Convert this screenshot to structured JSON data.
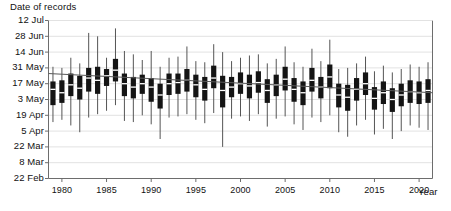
{
  "axes": {
    "y_title": "Date of records",
    "x_title": "Year",
    "y_tick_labels": [
      "12 Jul",
      "28 Jun",
      "14 Jun",
      "31 May",
      "17 May",
      "3 May",
      "19 Apr",
      "5 Apr",
      "22 Mar",
      "8 Mar",
      "22 Feb"
    ],
    "x_tick_labels": [
      "1980",
      "1985",
      "1990",
      "1995",
      "2000",
      "2005",
      "2010",
      "2015",
      "2020"
    ]
  },
  "colors": {
    "box": "#141414",
    "median": "#ffffff",
    "whisker": "#555555",
    "grid": "#e2e2e2",
    "frame": "#6d6d6d",
    "trend": "#5a5a5a",
    "text": "#111111",
    "background": "#ffffff"
  },
  "chart_data": {
    "type": "box",
    "title": "",
    "subtitle": "",
    "xlabel": "Year",
    "ylabel": "Date of records",
    "grid": true,
    "legend": "none",
    "y_unit": "day-of-year",
    "y_tick_labels": [
      "12 Jul",
      "28 Jun",
      "14 Jun",
      "31 May",
      "17 May",
      "3 May",
      "19 Apr",
      "5 Apr",
      "22 Mar",
      "8 Mar",
      "22 Feb"
    ],
    "y_tick_doy": [
      193,
      179,
      165,
      151,
      137,
      123,
      109,
      95,
      81,
      67,
      53
    ],
    "ylim_doy": [
      53,
      193
    ],
    "xlim": [
      1978.5,
      2021.5
    ],
    "x_ticks": [
      1980,
      1985,
      1990,
      1995,
      2000,
      2005,
      2010,
      2015,
      2020
    ],
    "note": "Each entry is one year's distribution of record dates: [year, whisker_low, q1, median, q3, whisker_high] in day-of-year",
    "boxes": [
      [
        1979,
        103,
        118,
        132,
        139,
        152
      ],
      [
        1980,
        105,
        120,
        129,
        140,
        151
      ],
      [
        1981,
        100,
        126,
        136,
        146,
        160
      ],
      [
        1982,
        94,
        123,
        133,
        144,
        155
      ],
      [
        1983,
        107,
        130,
        142,
        151,
        182
      ],
      [
        1984,
        110,
        128,
        140,
        152,
        179
      ],
      [
        1985,
        113,
        135,
        144,
        150,
        160
      ],
      [
        1986,
        118,
        139,
        149,
        159,
        186
      ],
      [
        1987,
        104,
        126,
        137,
        146,
        166
      ],
      [
        1988,
        103,
        124,
        134,
        143,
        163
      ],
      [
        1989,
        109,
        128,
        137,
        145,
        158
      ],
      [
        1990,
        101,
        121,
        134,
        142,
        166
      ],
      [
        1991,
        88,
        115,
        127,
        137,
        152
      ],
      [
        1992,
        107,
        127,
        137,
        146,
        160
      ],
      [
        1993,
        108,
        128,
        138,
        146,
        161
      ],
      [
        1994,
        110,
        130,
        140,
        150,
        170
      ],
      [
        1995,
        105,
        125,
        136,
        145,
        157
      ],
      [
        1996,
        102,
        122,
        132,
        143,
        156
      ],
      [
        1997,
        111,
        133,
        142,
        153,
        172
      ],
      [
        1998,
        81,
        116,
        131,
        144,
        165
      ],
      [
        1999,
        106,
        125,
        134,
        143,
        157
      ],
      [
        2000,
        108,
        128,
        137,
        147,
        160
      ],
      [
        2001,
        104,
        124,
        135,
        145,
        162
      ],
      [
        2002,
        110,
        129,
        138,
        148,
        163
      ],
      [
        2003,
        99,
        120,
        131,
        141,
        155
      ],
      [
        2004,
        106,
        126,
        136,
        145,
        159
      ],
      [
        2005,
        108,
        131,
        141,
        152,
        170
      ],
      [
        2006,
        101,
        121,
        132,
        142,
        156
      ],
      [
        2007,
        96,
        118,
        129,
        139,
        152
      ],
      [
        2008,
        107,
        130,
        140,
        151,
        168
      ],
      [
        2009,
        103,
        124,
        134,
        143,
        157
      ],
      [
        2010,
        109,
        133,
        143,
        154,
        176
      ],
      [
        2011,
        94,
        116,
        127,
        137,
        150
      ],
      [
        2012,
        90,
        113,
        125,
        136,
        151
      ],
      [
        2013,
        100,
        122,
        132,
        142,
        155
      ],
      [
        2014,
        105,
        127,
        137,
        147,
        161
      ],
      [
        2015,
        92,
        114,
        124,
        134,
        148
      ],
      [
        2016,
        97,
        119,
        129,
        139,
        153
      ],
      [
        2017,
        88,
        112,
        123,
        133,
        147
      ],
      [
        2018,
        95,
        117,
        127,
        137,
        150
      ],
      [
        2019,
        100,
        120,
        130,
        140,
        154
      ],
      [
        2020,
        98,
        119,
        129,
        139,
        152
      ],
      [
        2021,
        96,
        120,
        131,
        141,
        156
      ]
    ],
    "trend_line": {
      "visible": true,
      "x_start": 1978.5,
      "x_end": 2021.5,
      "y_start_doy": 146,
      "y_end_doy": 129
    }
  }
}
